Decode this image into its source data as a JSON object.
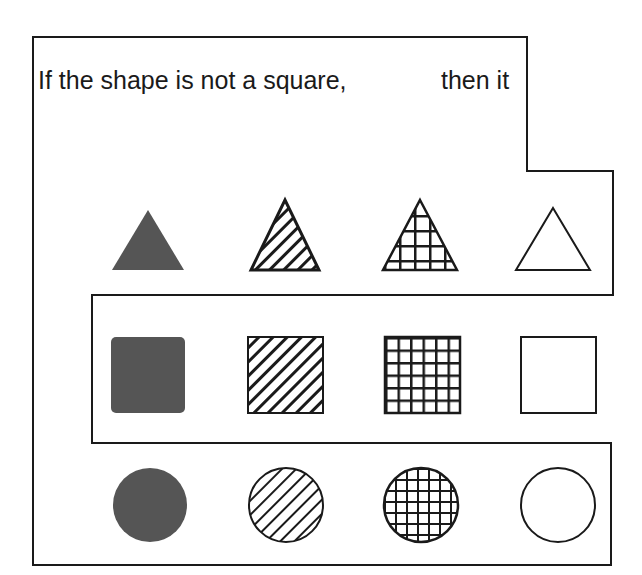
{
  "caption": {
    "condition": "If the shape is not a square,",
    "consequence": "then it"
  },
  "colors": {
    "ink": "#1a1a1a",
    "solid_fill": "#555555",
    "background": "#ffffff"
  },
  "grid": {
    "rows": [
      "triangle",
      "square",
      "circle"
    ],
    "columns": [
      "solid",
      "striped",
      "checkered",
      "blank"
    ]
  },
  "shapes": [
    {
      "shape": "triangle",
      "fill": "solid"
    },
    {
      "shape": "triangle",
      "fill": "striped"
    },
    {
      "shape": "triangle",
      "fill": "checkered"
    },
    {
      "shape": "triangle",
      "fill": "blank"
    },
    {
      "shape": "square",
      "fill": "solid"
    },
    {
      "shape": "square",
      "fill": "striped"
    },
    {
      "shape": "square",
      "fill": "checkered"
    },
    {
      "shape": "square",
      "fill": "blank"
    },
    {
      "shape": "circle",
      "fill": "solid"
    },
    {
      "shape": "circle",
      "fill": "striped"
    },
    {
      "shape": "circle",
      "fill": "checkered"
    },
    {
      "shape": "circle",
      "fill": "blank"
    }
  ],
  "region": {
    "description": "Outline encloses all non-square shapes (triangles and circles), excluding the square row"
  }
}
